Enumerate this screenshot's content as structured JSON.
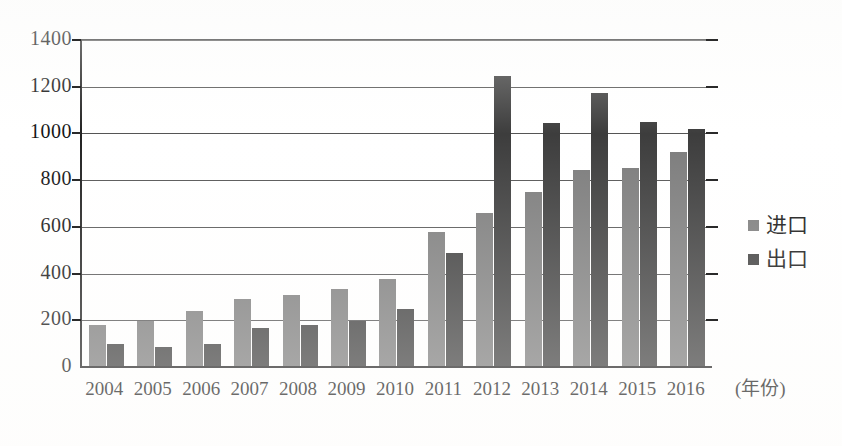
{
  "chart_data": {
    "type": "bar",
    "title": "",
    "xlabel": "(年份)",
    "ylabel": "",
    "categories": [
      "2004",
      "2005",
      "2006",
      "2007",
      "2008",
      "2009",
      "2010",
      "2011",
      "2012",
      "2013",
      "2014",
      "2015",
      "2016"
    ],
    "series": [
      {
        "name": "进口",
        "color": "#7c7c7c",
        "values": [
          180,
          195,
          240,
          290,
          310,
          335,
          375,
          580,
          660,
          750,
          845,
          850,
          920
        ]
      },
      {
        "name": "出口",
        "color": "#3d3d3d",
        "values": [
          100,
          85,
          100,
          165,
          180,
          195,
          250,
          490,
          1245,
          1045,
          1175,
          1050,
          1020
        ]
      }
    ],
    "ylim": [
      0,
      1400
    ],
    "yticks": [
      "0",
      "200",
      "400",
      "600",
      "800",
      "1000",
      "1200",
      "1400"
    ],
    "ytick_values": [
      0,
      200,
      400,
      600,
      800,
      1000,
      1200,
      1400
    ],
    "grid": true,
    "legend_position": "right"
  },
  "legend": {
    "items": [
      {
        "label": "进口",
        "swatch": "import"
      },
      {
        "label": "出口",
        "swatch": "export"
      }
    ]
  },
  "axes": {
    "x_title": "(年份)"
  }
}
